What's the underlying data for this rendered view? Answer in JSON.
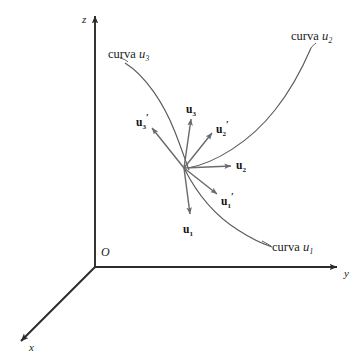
{
  "figure": {
    "type": "vector-diagram",
    "background_color": "#ffffff",
    "axis_color": "#2b2b2b",
    "curve_color": "#5a5a5a",
    "vector_color": "#6b6b6b",
    "text_color": "#1a1a1a"
  },
  "axes": {
    "origin_label": "O",
    "items": [
      {
        "name": "z-axis",
        "label": "z",
        "x1": 95,
        "y1": 267,
        "x2": 95,
        "y2": 16
      },
      {
        "name": "y-axis",
        "label": "y",
        "x1": 95,
        "y1": 267,
        "x2": 337,
        "y2": 267
      },
      {
        "name": "x-axis",
        "label": "x",
        "x1": 95,
        "y1": 267,
        "x2": 21,
        "y2": 341
      }
    ]
  },
  "curves": [
    {
      "name": "curve-u3",
      "caption": "curva",
      "symbol": "u",
      "subscript": "3",
      "path": "M 125,63 C 146,76 164,104 175,132 C 182,150 186,162 189,170"
    },
    {
      "name": "curve-u2",
      "caption": "curva",
      "symbol": "u",
      "subscript": "2",
      "path": "M 188,168 C 215,163 250,142 275,110 C 295,85 305,62 311,48"
    },
    {
      "name": "curve-u1",
      "caption": "curva",
      "symbol": "u",
      "subscript": "1",
      "path": "M 184,168 C 196,192 214,215 238,230 C 255,241 266,245 272,247"
    }
  ],
  "vectors": {
    "origin": {
      "x": 184,
      "y": 168
    },
    "items": [
      {
        "name": "u1",
        "label": "u",
        "subscript": "1",
        "prime": false,
        "tip_x": 190,
        "tip_y": 214,
        "label_x": 183,
        "label_y": 224
      },
      {
        "name": "u2",
        "label": "u",
        "subscript": "2",
        "prime": false,
        "tip_x": 231,
        "tip_y": 166,
        "label_x": 236,
        "label_y": 160
      },
      {
        "name": "u3",
        "label": "u",
        "subscript": "3",
        "prime": false,
        "tip_x": 191,
        "tip_y": 119,
        "label_x": 186,
        "label_y": 104
      },
      {
        "name": "u1-prime",
        "label": "u",
        "subscript": "1",
        "prime": true,
        "tip_x": 217,
        "tip_y": 194,
        "label_x": 221,
        "label_y": 196
      },
      {
        "name": "u2-prime",
        "label": "u",
        "subscript": "2",
        "prime": true,
        "tip_x": 212,
        "tip_y": 133,
        "label_x": 216,
        "label_y": 124
      },
      {
        "name": "u3-prime",
        "label": "u",
        "subscript": "3",
        "prime": true,
        "tip_x": 152,
        "tip_y": 128,
        "label_x": 136,
        "label_y": 117
      }
    ]
  },
  "labels": {
    "curve_u3": {
      "x": 108,
      "y": 48
    },
    "curve_u2": {
      "x": 291,
      "y": 30
    },
    "curve_u1": {
      "x": 272,
      "y": 241
    },
    "axis_z": {
      "x": 82,
      "y": 14
    },
    "axis_y": {
      "x": 344,
      "y": 268
    },
    "axis_x": {
      "x": 29,
      "y": 342
    },
    "origin": {
      "x": 101,
      "y": 246
    }
  }
}
